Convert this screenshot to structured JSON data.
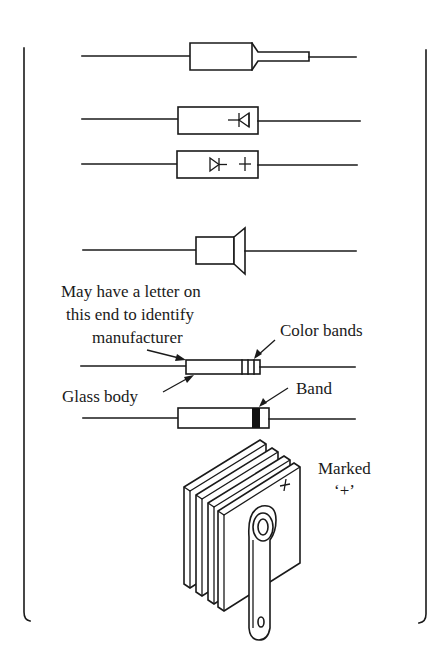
{
  "diagram": {
    "colors": {
      "ink": "#1a1a1a",
      "background": "#ffffff"
    },
    "components": [
      {
        "id": "tapered-body-diode",
        "description": "Axial diode with tapered cathode end"
      },
      {
        "id": "symbol-marked-diode-1",
        "description": "Axial diode with diode symbol printed on body"
      },
      {
        "id": "symbol-marked-diode-2",
        "description": "Axial diode with diode symbol and + sign printed on body"
      },
      {
        "id": "flanged-body-diode",
        "description": "Axial diode with flared end"
      },
      {
        "id": "glass-body-diode",
        "description": "Glass-body diode with color bands"
      },
      {
        "id": "banded-diode",
        "description": "Diode with single band marking cathode"
      },
      {
        "id": "selenium-stack-rectifier",
        "description": "Stacked-plate selenium rectifier with terminal tab"
      }
    ],
    "labels": {
      "letter_note_line1": "May have a letter on",
      "letter_note_line2": "this end to identify",
      "letter_note_line3": "manufacturer",
      "color_bands": "Color bands",
      "glass_body": "Glass body",
      "band": "Band",
      "marked_line1": "Marked",
      "marked_line2": "‘+’",
      "plus_on_body": "+",
      "plus_on_plate": "+"
    }
  }
}
